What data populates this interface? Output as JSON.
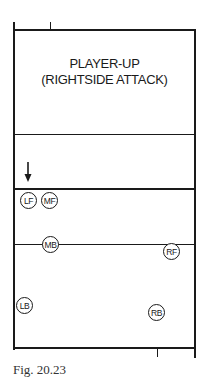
{
  "diagram": {
    "title_line1": "PLAYER-UP",
    "title_line2": "(RIGHTSIDE ATTACK)",
    "players": [
      {
        "id": "LF",
        "label": "LF",
        "x": 29,
        "y": 201
      },
      {
        "id": "MF",
        "label": "MF",
        "x": 50,
        "y": 201
      },
      {
        "id": "MB",
        "label": "MB",
        "x": 51,
        "y": 245
      },
      {
        "id": "RF",
        "label": "RF",
        "x": 172,
        "y": 252
      },
      {
        "id": "LB",
        "label": "LB",
        "x": 25,
        "y": 306
      },
      {
        "id": "RB",
        "label": "RB",
        "x": 157,
        "y": 313
      }
    ],
    "arrow": {
      "direction": "down",
      "x": 28,
      "y_start": 162,
      "y_end": 182
    },
    "colors": {
      "ink": "#1a1a1a",
      "background": "#ffffff"
    }
  },
  "caption": "Fig. 20.23"
}
